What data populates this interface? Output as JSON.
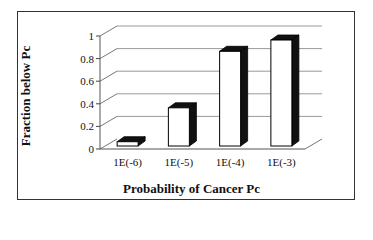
{
  "chart_data": {
    "type": "bar",
    "style": "3d-column",
    "title": "",
    "xlabel": "Probability of Cancer Pc",
    "ylabel": "Fraction below Pc",
    "categories": [
      "1E(-6)",
      "1E(-5)",
      "1E(-4)",
      "1E(-3)"
    ],
    "values": [
      0.1,
      0.4,
      0.9,
      1.0
    ],
    "ylim": [
      0,
      1
    ],
    "yticks": [
      "0",
      "0.2",
      "0.4",
      "0.6",
      "0.8",
      "1"
    ],
    "grid": true,
    "legend": null,
    "colors": {
      "bar_face": "#ffffff",
      "bar_side": "#111111",
      "grid": "#999999",
      "frame": "#333333"
    }
  }
}
